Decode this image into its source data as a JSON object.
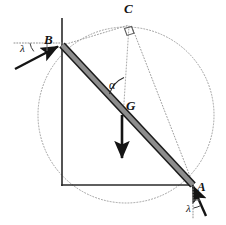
{
  "figure": {
    "colors": {
      "stroke_dark": "#141414",
      "rod_fill": "#8a8a8a",
      "rod_edge": "#1a1a1a",
      "dotted": "#9a9a9a",
      "background": "#ffffff"
    },
    "labels": {
      "point_a": "A",
      "point_b": "B",
      "point_c": "C",
      "center_of_gravity": "G",
      "angle_alpha": "α",
      "friction_angle_b": "λ",
      "friction_angle_a": "λ"
    },
    "geometry": {
      "wall_x": 62,
      "wall_top_y": 18,
      "floor_y": 185,
      "floor_right_x": 193,
      "point_b": [
        62,
        45
      ],
      "point_a": [
        193,
        185
      ],
      "point_c": [
        130,
        24
      ],
      "point_g": [
        122,
        115
      ],
      "circle_center": [
        126,
        115
      ],
      "circle_radius": 88,
      "rod_half_width": 3.2,
      "weight_arrow_from": [
        122,
        115
      ],
      "weight_arrow_to": [
        122,
        163
      ],
      "reaction_b_tail": [
        16,
        68
      ],
      "reaction_b_head": [
        60,
        46
      ],
      "reaction_a_tail": [
        205,
        215
      ],
      "reaction_a_head": [
        192,
        184
      ]
    },
    "elements": [
      {
        "name": "wall-line",
        "kind": "solid-line"
      },
      {
        "name": "floor-line",
        "kind": "solid-line"
      },
      {
        "name": "ladder-rod",
        "kind": "thick-bar"
      },
      {
        "name": "construction-circle",
        "kind": "dotted-circle"
      },
      {
        "name": "vertical-dotted-line-c-to-g",
        "kind": "dotted-line"
      },
      {
        "name": "dotted-line-c-to-a",
        "kind": "dotted-line"
      },
      {
        "name": "dotted-line-b-to-c",
        "kind": "dotted-line"
      },
      {
        "name": "right-angle-marker-at-c",
        "kind": "square-marker"
      },
      {
        "name": "angle-arc-alpha",
        "kind": "arc"
      },
      {
        "name": "weight-arrow",
        "kind": "arrow"
      },
      {
        "name": "reaction-arrow-b",
        "kind": "arrow"
      },
      {
        "name": "reaction-arrow-a",
        "kind": "arrow"
      },
      {
        "name": "angle-marker-lambda-b",
        "kind": "arc-with-dotted-ref"
      },
      {
        "name": "angle-marker-lambda-a",
        "kind": "arc-with-dotted-ref"
      }
    ]
  }
}
